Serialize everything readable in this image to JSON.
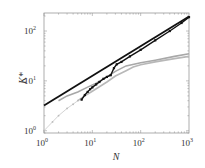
{
  "chart_data": {
    "type": "line",
    "title": "",
    "xlabel": "N",
    "ylabel": "K*",
    "xscale": "log",
    "yscale": "log",
    "xlim": [
      1,
      1000
    ],
    "ylim": [
      0.9,
      230
    ],
    "x_ticks": [
      {
        "base": "10",
        "exp": "0",
        "value": 1
      },
      {
        "base": "10",
        "exp": "1",
        "value": 10
      },
      {
        "base": "10",
        "exp": "2",
        "value": 100
      },
      {
        "base": "10",
        "exp": "3",
        "value": 1000
      }
    ],
    "y_ticks": [
      {
        "base": "10",
        "exp": "0",
        "value": 1
      },
      {
        "base": "10",
        "exp": "1",
        "value": 10
      },
      {
        "base": "10",
        "exp": "2",
        "value": 100
      }
    ],
    "grid": false,
    "legend": null,
    "series": [
      {
        "name": "power-law fit",
        "style": "solid-black-thick",
        "color": "#111111",
        "x": [
          1,
          1000
        ],
        "y": [
          3.2,
          195
        ]
      },
      {
        "name": "black markers",
        "style": "markers-black",
        "color": "#111111",
        "x": [
          6,
          7,
          8,
          9,
          10,
          12,
          14,
          17,
          20,
          24,
          28,
          32,
          40,
          60,
          100,
          200,
          400,
          700,
          1000
        ],
        "y": [
          4.2,
          5.2,
          6.0,
          6.8,
          7.4,
          8.5,
          9.5,
          11.0,
          12.0,
          13.0,
          18.0,
          21.5,
          24.0,
          31.0,
          42.0,
          65.0,
          100.0,
          145.0,
          190.0
        ]
      },
      {
        "name": "gray curve upper",
        "style": "solid-gray",
        "color": "#a8a8a8",
        "x": [
          2,
          3,
          5,
          8,
          12,
          20,
          30,
          50,
          100,
          200,
          500,
          1000
        ],
        "y": [
          4.0,
          5.0,
          6.0,
          7.5,
          9.0,
          12.0,
          15.5,
          20.0,
          23.0,
          26.0,
          31.0,
          35.0
        ]
      },
      {
        "name": "gray curve lower",
        "style": "solid-gray",
        "color": "#b8b8b8",
        "x": [
          5,
          7,
          10,
          14,
          20,
          30,
          50,
          70,
          100,
          200,
          500,
          1000
        ],
        "y": [
          4.0,
          5.0,
          6.2,
          7.6,
          9.5,
          12.5,
          16.0,
          19.0,
          21.0,
          24.0,
          28.0,
          31.0
        ]
      },
      {
        "name": "light gray dotted",
        "style": "dotted-lightgray",
        "color": "#c8c8c8",
        "x": [
          1,
          1.5,
          2,
          3,
          4,
          5
        ],
        "y": [
          1.0,
          1.5,
          2.0,
          2.8,
          3.4,
          4.0
        ]
      }
    ]
  }
}
